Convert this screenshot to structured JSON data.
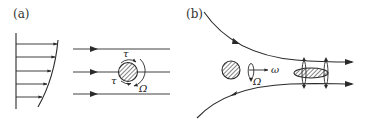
{
  "figure": {
    "panels": [
      {
        "id": "a",
        "label": "(a)",
        "description": "Sphere in linear shear flow rotating due to viscous torque",
        "symbols": {
          "torque_top": "τ",
          "torque_bottom": "τ",
          "rotation": "Ω"
        },
        "velocity_profile_arrows": 5,
        "streamlines": 3
      },
      {
        "id": "b",
        "label": "(b)",
        "description": "Particle in converging (extensional) flow with rotation aligned to flow axis",
        "symbols": {
          "axial_rotation": "ω",
          "spin": "Ω"
        },
        "streamlines": 2
      }
    ],
    "colors": {
      "ink": "#2a2a2a",
      "background": "#ffffff"
    }
  }
}
